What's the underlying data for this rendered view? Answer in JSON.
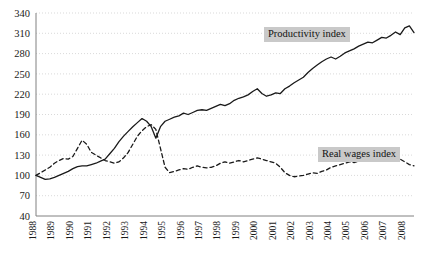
{
  "chart_data": {
    "type": "line",
    "title": "",
    "xlabel": "",
    "ylabel": "",
    "grid": true,
    "legend_position": "inline-annotations",
    "ylim": [
      40,
      340
    ],
    "ytick_step": 30,
    "yticks": [
      40,
      70,
      100,
      130,
      160,
      190,
      220,
      250,
      280,
      310,
      340
    ],
    "xlim": [
      1988,
      2008
    ],
    "xticks": [
      1988,
      1989,
      1990,
      1991,
      1992,
      1993,
      1994,
      1995,
      1996,
      1997,
      1998,
      1999,
      2000,
      2001,
      2002,
      2003,
      2004,
      2005,
      2006,
      2007,
      2008
    ],
    "xtick_labels": [
      "1988",
      "1989",
      "1990",
      "1991",
      "1992",
      "1993",
      "1994",
      "1995",
      "1996",
      "1997",
      "1998",
      "1999",
      "2000",
      "2001",
      "2002",
      "2003",
      "2004",
      "2005",
      "2006",
      "2007",
      "2008"
    ],
    "x_quarterly": [
      1988.0,
      1988.25,
      1988.5,
      1988.75,
      1989.0,
      1989.25,
      1989.5,
      1989.75,
      1990.0,
      1990.25,
      1990.5,
      1990.75,
      1991.0,
      1991.25,
      1991.5,
      1991.75,
      1992.0,
      1992.25,
      1992.5,
      1992.75,
      1993.0,
      1993.25,
      1993.5,
      1993.75,
      1994.0,
      1994.25,
      1994.5,
      1994.75,
      1995.0,
      1995.25,
      1995.5,
      1995.75,
      1996.0,
      1996.25,
      1996.5,
      1996.75,
      1997.0,
      1997.25,
      1997.5,
      1997.75,
      1998.0,
      1998.25,
      1998.5,
      1998.75,
      1999.0,
      1999.25,
      1999.5,
      1999.75,
      2000.0,
      2000.25,
      2000.5,
      2000.75,
      2001.0,
      2001.25,
      2001.5,
      2001.75,
      2002.0,
      2002.25,
      2002.5,
      2002.75,
      2003.0,
      2003.25,
      2003.5,
      2003.75,
      2004.0,
      2004.25,
      2004.5,
      2004.75,
      2005.0,
      2005.25,
      2005.5,
      2005.75,
      2006.0,
      2006.25,
      2006.5,
      2006.75,
      2007.0,
      2007.25,
      2007.5,
      2007.75,
      2008.0,
      2008.25,
      2008.5
    ],
    "series": [
      {
        "name": "Productivity index",
        "style": "solid",
        "color": "#1a1a1a",
        "values": [
          100,
          97,
          94,
          95,
          97,
          100,
          103,
          106,
          110,
          113,
          114,
          114,
          116,
          118,
          121,
          124,
          132,
          140,
          150,
          158,
          165,
          172,
          178,
          184,
          180,
          172,
          155,
          172,
          180,
          183,
          186,
          188,
          192,
          190,
          193,
          196,
          197,
          196,
          199,
          202,
          205,
          203,
          206,
          211,
          214,
          216,
          219,
          224,
          228,
          221,
          217,
          219,
          222,
          221,
          228,
          232,
          237,
          241,
          245,
          252,
          258,
          263,
          268,
          272,
          275,
          272,
          276,
          281,
          284,
          287,
          291,
          294,
          297,
          296,
          300,
          304,
          303,
          307,
          312,
          308,
          318,
          321,
          311
        ]
      },
      {
        "name": "Real wages index",
        "style": "dashed",
        "color": "#1a1a1a",
        "values": [
          100,
          104,
          108,
          112,
          118,
          122,
          125,
          124,
          128,
          140,
          152,
          146,
          134,
          130,
          126,
          122,
          120,
          118,
          120,
          126,
          134,
          146,
          158,
          166,
          172,
          175,
          168,
          140,
          112,
          104,
          106,
          108,
          110,
          109,
          112,
          114,
          112,
          111,
          112,
          114,
          118,
          120,
          118,
          120,
          122,
          120,
          122,
          124,
          126,
          124,
          122,
          120,
          118,
          112,
          104,
          100,
          98,
          99,
          100,
          102,
          104,
          103,
          106,
          108,
          112,
          114,
          116,
          118,
          120,
          119,
          121,
          122,
          124,
          123,
          125,
          126,
          128,
          127,
          126,
          124,
          120,
          116,
          114
        ]
      }
    ],
    "annotations": [
      {
        "name": "Productivity index",
        "text": "Productivity index"
      },
      {
        "name": "Real wages index",
        "text": "Real wages index"
      }
    ]
  },
  "labels": {
    "productivity": "Productivity index",
    "real_wages": "Real wages index"
  },
  "colors": {
    "axis": "#808080",
    "grid": "#cfcfcf",
    "line": "#1a1a1a",
    "label_bg": "#c9c9c9",
    "text": "#111111"
  }
}
